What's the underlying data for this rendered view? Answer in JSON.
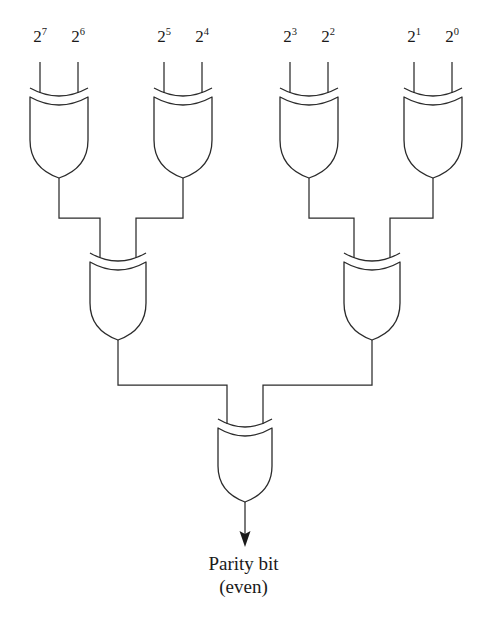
{
  "diagram": {
    "line_color": "#2b2b2b",
    "background_color": "#ffffff",
    "inputs": [
      {
        "id": "in7",
        "base": "2",
        "exponent": "7",
        "label": "2⁷",
        "x": 40,
        "y": 44
      },
      {
        "id": "in6",
        "base": "2",
        "exponent": "6",
        "label": "2⁶",
        "x": 78,
        "y": 44
      },
      {
        "id": "in5",
        "base": "2",
        "exponent": "5",
        "label": "2⁵",
        "x": 164,
        "y": 44
      },
      {
        "id": "in4",
        "base": "2",
        "exponent": "4",
        "label": "2⁴",
        "x": 202,
        "y": 44
      },
      {
        "id": "in3",
        "base": "2",
        "exponent": "3",
        "label": "2³",
        "x": 290,
        "y": 44
      },
      {
        "id": "in2",
        "base": "2",
        "exponent": "2",
        "label": "2²",
        "x": 328,
        "y": 44
      },
      {
        "id": "in1",
        "base": "2",
        "exponent": "1",
        "label": "2¹",
        "x": 414,
        "y": 44
      },
      {
        "id": "in0",
        "base": "2",
        "exponent": "0",
        "label": "2⁰",
        "x": 452,
        "y": 44
      }
    ],
    "gates": [
      {
        "id": "xor-l1-a",
        "type": "xor",
        "level": 1,
        "cx": 59,
        "top": 97,
        "bottom": 178,
        "half_width": 29,
        "inputs": [
          "in7",
          "in6"
        ]
      },
      {
        "id": "xor-l1-b",
        "type": "xor",
        "level": 1,
        "cx": 183,
        "top": 97,
        "bottom": 178,
        "half_width": 29,
        "inputs": [
          "in5",
          "in4"
        ]
      },
      {
        "id": "xor-l1-c",
        "type": "xor",
        "level": 1,
        "cx": 309,
        "top": 97,
        "bottom": 178,
        "half_width": 29,
        "inputs": [
          "in3",
          "in2"
        ]
      },
      {
        "id": "xor-l1-d",
        "type": "xor",
        "level": 1,
        "cx": 433,
        "top": 97,
        "bottom": 178,
        "half_width": 29,
        "inputs": [
          "in1",
          "in0"
        ]
      },
      {
        "id": "xor-l2-a",
        "type": "xor",
        "level": 2,
        "cx": 118,
        "top": 262,
        "bottom": 340,
        "half_width": 28,
        "inputs": [
          "xor-l1-a",
          "xor-l1-b"
        ]
      },
      {
        "id": "xor-l2-b",
        "type": "xor",
        "level": 2,
        "cx": 372,
        "top": 262,
        "bottom": 340,
        "half_width": 28,
        "inputs": [
          "xor-l1-c",
          "xor-l1-d"
        ]
      },
      {
        "id": "xor-l3",
        "type": "xor",
        "level": 3,
        "cx": 245,
        "top": 428,
        "bottom": 502,
        "half_width": 27,
        "inputs": [
          "xor-l2-a",
          "xor-l2-b"
        ]
      }
    ],
    "buses": [
      {
        "id": "bus-level1-left",
        "y": 218,
        "x1": 59,
        "x2": 183
      },
      {
        "id": "bus-level1-right",
        "y": 218,
        "x1": 309,
        "x2": 433
      },
      {
        "id": "bus-level2",
        "y": 385,
        "x1": 118,
        "x2": 372
      }
    ],
    "output": {
      "id": "parity-output",
      "wire_x": 245,
      "wire_top": 502,
      "arrow_tip_y": 546,
      "line1": "Parity bit",
      "line2": "(even)",
      "text_x": 245,
      "text_y": 554
    }
  }
}
